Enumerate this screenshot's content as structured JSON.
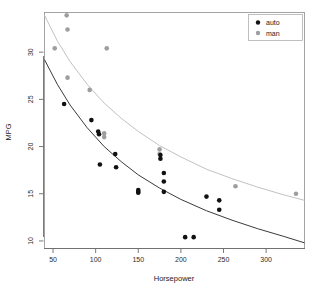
{
  "chart_data": {
    "type": "scatter",
    "title": "",
    "xlabel": "Horsepower",
    "ylabel": "MPG",
    "xlim": [
      40,
      345
    ],
    "ylim": [
      9.2,
      34.2
    ],
    "xticks": [
      50,
      100,
      150,
      200,
      250,
      300
    ],
    "yticks": [
      10,
      15,
      20,
      25,
      30
    ],
    "grid": false,
    "legend_position": "top-right",
    "series": [
      {
        "name": "auto",
        "color": "#111111",
        "marker": "filled-circle",
        "points": [
          {
            "x": 63,
            "y": 24.5
          },
          {
            "x": 95,
            "y": 22.8
          },
          {
            "x": 103,
            "y": 21.6
          },
          {
            "x": 104,
            "y": 21.3
          },
          {
            "x": 105,
            "y": 18.1
          },
          {
            "x": 123,
            "y": 19.2
          },
          {
            "x": 124,
            "y": 17.8
          },
          {
            "x": 150,
            "y": 15.4
          },
          {
            "x": 150,
            "y": 15.2
          },
          {
            "x": 150,
            "y": 15.1
          },
          {
            "x": 176,
            "y": 19.1
          },
          {
            "x": 176,
            "y": 18.7
          },
          {
            "x": 180,
            "y": 17.2
          },
          {
            "x": 180,
            "y": 16.3
          },
          {
            "x": 180,
            "y": 15.2
          },
          {
            "x": 205,
            "y": 10.4
          },
          {
            "x": 215,
            "y": 10.4
          },
          {
            "x": 230,
            "y": 14.7
          },
          {
            "x": 245,
            "y": 14.3
          },
          {
            "x": 245,
            "y": 13.3
          }
        ],
        "fit_color": "#3a3a3a",
        "fit_curve": [
          {
            "x": 40,
            "y": 29.2
          },
          {
            "x": 55,
            "y": 26.6
          },
          {
            "x": 70,
            "y": 24.4
          },
          {
            "x": 90,
            "y": 22.0
          },
          {
            "x": 110,
            "y": 20.0
          },
          {
            "x": 130,
            "y": 18.4
          },
          {
            "x": 150,
            "y": 17.0
          },
          {
            "x": 175,
            "y": 15.6
          },
          {
            "x": 200,
            "y": 14.4
          },
          {
            "x": 230,
            "y": 13.2
          },
          {
            "x": 260,
            "y": 12.2
          },
          {
            "x": 290,
            "y": 11.3
          },
          {
            "x": 320,
            "y": 10.5
          },
          {
            "x": 345,
            "y": 9.8
          }
        ]
      },
      {
        "name": "man",
        "color": "#9e9e9e",
        "marker": "filled-circle",
        "points": [
          {
            "x": 52,
            "y": 30.4
          },
          {
            "x": 66,
            "y": 33.9
          },
          {
            "x": 67,
            "y": 32.4
          },
          {
            "x": 67,
            "y": 27.3
          },
          {
            "x": 93,
            "y": 26.0
          },
          {
            "x": 110,
            "y": 21.4
          },
          {
            "x": 110,
            "y": 21.0
          },
          {
            "x": 113,
            "y": 30.4
          },
          {
            "x": 175,
            "y": 19.7
          },
          {
            "x": 175,
            "y": 19.2
          },
          {
            "x": 264,
            "y": 15.8
          },
          {
            "x": 335,
            "y": 15.0
          }
        ],
        "fit_color": "#c2c2c2",
        "fit_curve": [
          {
            "x": 40,
            "y": 33.9
          },
          {
            "x": 55,
            "y": 31.2
          },
          {
            "x": 70,
            "y": 29.0
          },
          {
            "x": 90,
            "y": 26.6
          },
          {
            "x": 110,
            "y": 24.6
          },
          {
            "x": 130,
            "y": 23.0
          },
          {
            "x": 150,
            "y": 21.6
          },
          {
            "x": 175,
            "y": 20.1
          },
          {
            "x": 200,
            "y": 18.9
          },
          {
            "x": 230,
            "y": 17.6
          },
          {
            "x": 260,
            "y": 16.6
          },
          {
            "x": 290,
            "y": 15.7
          },
          {
            "x": 320,
            "y": 14.9
          },
          {
            "x": 345,
            "y": 14.3
          }
        ]
      }
    ],
    "legend": [
      {
        "label": "auto",
        "color": "#111111"
      },
      {
        "label": "man",
        "color": "#9e9e9e"
      }
    ]
  }
}
